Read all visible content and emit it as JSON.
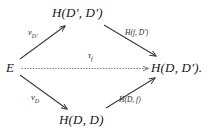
{
  "diagram": {
    "kind": "commutative-diagram",
    "nodes": {
      "source": "E",
      "top": "H(D', D')",
      "bottom": "H(D, D)",
      "target": "H(D, D')."
    },
    "edges": {
      "upper_left": "v_D'",
      "lower_left": "v_D",
      "upper_right": "H(f, D')",
      "lower_right": "H(D, f)",
      "center": "τ_f"
    },
    "edge_labels_rendered": {
      "upper_left_base": "v",
      "upper_left_sub": "D'",
      "lower_left_base": "v",
      "lower_left_sub": "D",
      "upper_right": "H(f, D')",
      "lower_right": "H(D, f)",
      "center_base": "τ",
      "center_sub": "f"
    },
    "styles": {
      "stroke": "#3a3a3a",
      "background": "#ffffff",
      "center_edge_style": "dotted",
      "diagonal_edge_style": "solid"
    }
  }
}
